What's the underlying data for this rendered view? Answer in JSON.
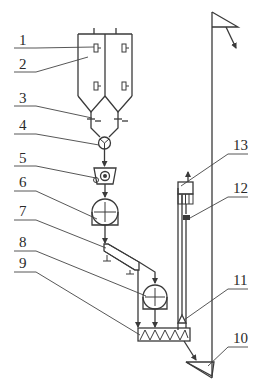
{
  "diagram": {
    "type": "process-flow-schematic",
    "colors": {
      "line": "#3a3a3a",
      "background": "#ffffff"
    },
    "callouts": [
      {
        "id": "1",
        "label": "1"
      },
      {
        "id": "2",
        "label": "2"
      },
      {
        "id": "3",
        "label": "3"
      },
      {
        "id": "4",
        "label": "4"
      },
      {
        "id": "5",
        "label": "5"
      },
      {
        "id": "6",
        "label": "6"
      },
      {
        "id": "7",
        "label": "7"
      },
      {
        "id": "8",
        "label": "8"
      },
      {
        "id": "9",
        "label": "9"
      },
      {
        "id": "10",
        "label": "10"
      },
      {
        "id": "11",
        "label": "11"
      },
      {
        "id": "12",
        "label": "12"
      },
      {
        "id": "13",
        "label": "13"
      }
    ],
    "components": [
      {
        "callout": "1",
        "icon": "level-indicator-icon"
      },
      {
        "callout": "2",
        "icon": "twin-silo-icon"
      },
      {
        "callout": "3",
        "icon": "gate-valve-icon"
      },
      {
        "callout": "4",
        "icon": "rotary-feeder-icon"
      },
      {
        "callout": "5",
        "icon": "pump-icon"
      },
      {
        "callout": "6",
        "icon": "scale-hopper-icon"
      },
      {
        "callout": "7",
        "icon": "inclined-conveyor-icon"
      },
      {
        "callout": "8",
        "icon": "weighing-hopper-icon"
      },
      {
        "callout": "9",
        "icon": "screw-mixer-icon"
      },
      {
        "callout": "10",
        "icon": "bucket-elevator-icon"
      },
      {
        "callout": "11",
        "icon": "inlet-funnel-icon"
      },
      {
        "callout": "12",
        "icon": "valve-icon"
      },
      {
        "callout": "13",
        "icon": "dust-collector-icon"
      }
    ]
  }
}
